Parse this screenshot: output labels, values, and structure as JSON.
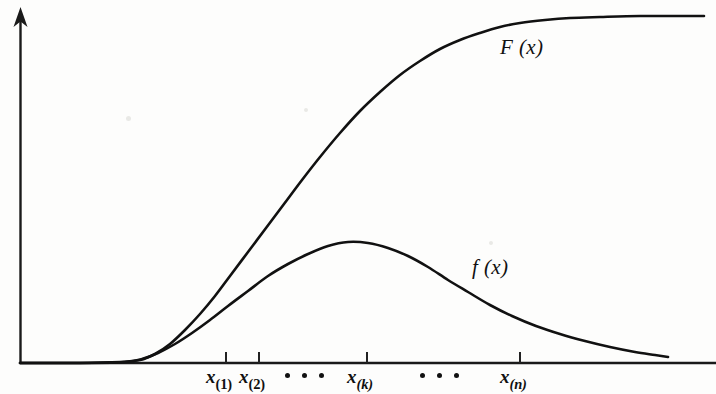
{
  "figure": {
    "background_color": "#fdfdfc",
    "ink_color": "#111111"
  },
  "axes": {
    "y_axis": {
      "name": "vertical-axis",
      "has_arrowhead": true,
      "x": 20,
      "top": 8,
      "bottom": 363
    },
    "x_axis": {
      "name": "horizontal-axis",
      "has_arrowhead": false,
      "y": 363,
      "left": 20,
      "right": 716
    },
    "x_tick_positions": [
      226,
      259,
      367,
      520
    ],
    "tick_length": 11
  },
  "tick_labels": [
    {
      "base": "x",
      "sub": "(1)",
      "sub_italic": false,
      "x": 226
    },
    {
      "base": "x",
      "sub": "(2)",
      "sub_italic": false,
      "x": 259
    },
    {
      "base": "x",
      "sub": "(k)",
      "sub_italic": true,
      "x": 367
    },
    {
      "base": "x",
      "sub": "(n)",
      "sub_italic": true,
      "x": 520
    }
  ],
  "ellipses": [
    {
      "name": "ellipsis-between-x2-and-xk",
      "dot_count": 3,
      "left": 285,
      "top": 371
    },
    {
      "name": "ellipsis-between-xk-and-xn",
      "dot_count": 3,
      "left": 420,
      "top": 371
    }
  ],
  "curve_labels": [
    {
      "name": "cdf-curve-label",
      "text": "F (x)",
      "left": 500,
      "top": 37
    },
    {
      "name": "pdf-curve-label",
      "text": "f (x)",
      "left": 472,
      "top": 257
    }
  ],
  "chart_data": {
    "type": "line",
    "title": "",
    "xlabel": "",
    "ylabel": "",
    "grid": false,
    "legend": "inline-annotations",
    "xlim": [
      20,
      716
    ],
    "ylim": [
      363,
      8
    ],
    "axis_note": "Unlabeled axes; y-axis is an arrow, x-axis is a plain rule with four ticks",
    "x_ticks": [
      {
        "label": "x(1)",
        "pixel_x": 226
      },
      {
        "label": "x(2)",
        "pixel_x": 259
      },
      {
        "label": "x(k)",
        "pixel_x": 367
      },
      {
        "label": "x(n)",
        "pixel_x": 520
      }
    ],
    "series": [
      {
        "name": "F (x)",
        "role": "cumulative distribution function",
        "shape": "sigmoid / S-curve rising to a horizontal asymptote",
        "stroke": "#111111",
        "points": [
          [
            20,
            363
          ],
          [
            80,
            363
          ],
          [
            120,
            362
          ],
          [
            140,
            360
          ],
          [
            155,
            354
          ],
          [
            170,
            344
          ],
          [
            185,
            330
          ],
          [
            200,
            314
          ],
          [
            215,
            296
          ],
          [
            230,
            276
          ],
          [
            248,
            252
          ],
          [
            266,
            228
          ],
          [
            284,
            204
          ],
          [
            302,
            180
          ],
          [
            320,
            157
          ],
          [
            340,
            133
          ],
          [
            360,
            111
          ],
          [
            380,
            92
          ],
          [
            400,
            75
          ],
          [
            420,
            61
          ],
          [
            440,
            49
          ],
          [
            460,
            40
          ],
          [
            480,
            33
          ],
          [
            500,
            27
          ],
          [
            520,
            23
          ],
          [
            545,
            20
          ],
          [
            570,
            18
          ],
          [
            600,
            17
          ],
          [
            640,
            16
          ],
          [
            680,
            16
          ],
          [
            704,
            16
          ]
        ]
      },
      {
        "name": "f (x)",
        "role": "probability density function",
        "shape": "unimodal bell with peak near x(k) and a long right tail",
        "stroke": "#111111",
        "peak": {
          "pixel_x": 348,
          "pixel_y": 242
        },
        "points": [
          [
            20,
            363
          ],
          [
            90,
            363
          ],
          [
            125,
            362
          ],
          [
            142,
            359
          ],
          [
            158,
            353
          ],
          [
            175,
            344
          ],
          [
            192,
            333
          ],
          [
            210,
            320
          ],
          [
            228,
            306
          ],
          [
            248,
            291
          ],
          [
            268,
            276
          ],
          [
            288,
            264
          ],
          [
            308,
            254
          ],
          [
            328,
            246
          ],
          [
            348,
            242
          ],
          [
            368,
            243
          ],
          [
            388,
            248
          ],
          [
            408,
            256
          ],
          [
            428,
            267
          ],
          [
            448,
            280
          ],
          [
            468,
            292
          ],
          [
            490,
            305
          ],
          [
            512,
            316
          ],
          [
            536,
            326
          ],
          [
            560,
            334
          ],
          [
            585,
            341
          ],
          [
            610,
            347
          ],
          [
            635,
            352
          ],
          [
            655,
            355
          ],
          [
            668,
            357
          ]
        ]
      }
    ]
  }
}
